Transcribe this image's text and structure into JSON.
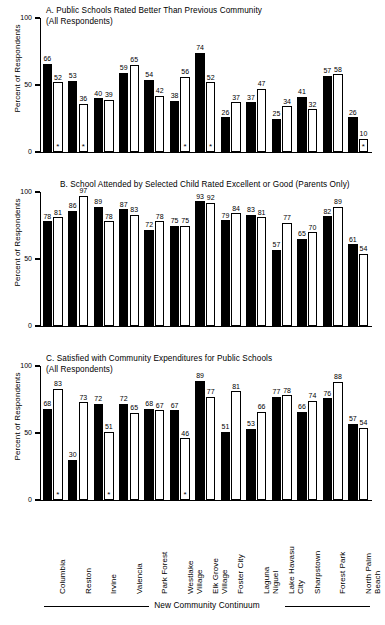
{
  "figure": {
    "ylabel": "Percent of Respondents",
    "x_axis_caption": "New Community Continuum",
    "categories": [
      "Columbia",
      "Reston",
      "Irvine",
      "Valencia",
      "Park Forest",
      "Westlake\nVillage",
      "Elk Grove\nVillage",
      "Foster City",
      "Laguna\nNiguel",
      "Lake Havasu\nCity",
      "Sharpstown",
      "Forest Park",
      "North Palm\nBeach"
    ],
    "yticks": [
      "0",
      "50",
      "100"
    ],
    "ylim": [
      0,
      100
    ],
    "significance_marker": "*"
  },
  "chart_data": [
    {
      "id": "A",
      "type": "bar",
      "title": "A.  Public Schools Rated Better Than Previous Community\n(All Respondents)",
      "xlabel": "New Community Continuum",
      "ylabel": "Percent of Respondents",
      "ylim": [
        0,
        100
      ],
      "yticks": [
        0,
        50,
        100
      ],
      "grid": false,
      "legend": "none",
      "categories": [
        "Columbia",
        "Reston",
        "Irvine",
        "Valencia",
        "Park Forest",
        "Westlake Village",
        "Elk Grove Village",
        "Foster City",
        "Laguna Niguel",
        "Lake Havasu City",
        "Sharpstown",
        "Forest Park",
        "North Palm Beach"
      ],
      "series": [
        {
          "name": "New Community",
          "style": "solid",
          "values": [
            66,
            53,
            40,
            59,
            54,
            38,
            74,
            26,
            37,
            25,
            41,
            57,
            26
          ]
        },
        {
          "name": "Paired Conventional Community",
          "style": "open",
          "values": [
            52,
            36,
            39,
            65,
            42,
            56,
            52,
            37,
            47,
            34,
            32,
            58,
            10
          ]
        }
      ],
      "markers": [
        {
          "category_index": 0,
          "series": "open",
          "symbol": "*"
        },
        {
          "category_index": 1,
          "series": "open",
          "symbol": "*"
        },
        {
          "category_index": 5,
          "series": "open",
          "symbol": "*"
        },
        {
          "category_index": 6,
          "series": "open",
          "symbol": "*"
        },
        {
          "category_index": 12,
          "series": "open",
          "symbol": "*"
        }
      ]
    },
    {
      "id": "B",
      "type": "bar",
      "title": "B.  School Attended by Selected Child Rated Excellent or Good (Parents Only)",
      "xlabel": "New Community Continuum",
      "ylabel": "Percent of Respondents",
      "ylim": [
        0,
        100
      ],
      "yticks": [
        0,
        50,
        100
      ],
      "grid": false,
      "legend": "none",
      "categories": [
        "Columbia",
        "Reston",
        "Irvine",
        "Valencia",
        "Park Forest",
        "Westlake Village",
        "Elk Grove Village",
        "Foster City",
        "Laguna Niguel",
        "Lake Havasu City",
        "Sharpstown",
        "Forest Park",
        "North Palm Beach"
      ],
      "series": [
        {
          "name": "New Community",
          "style": "solid",
          "values": [
            78,
            86,
            89,
            87,
            72,
            75,
            93,
            79,
            83,
            57,
            65,
            82,
            61
          ]
        },
        {
          "name": "Paired Conventional Community",
          "style": "open",
          "values": [
            81,
            97,
            78,
            83,
            78,
            75,
            92,
            84,
            81,
            77,
            70,
            89,
            54
          ]
        }
      ],
      "markers": []
    },
    {
      "id": "C",
      "type": "bar",
      "title": "C.  Satisfied with Community Expenditures for Public Schools\n(All Respondents)",
      "xlabel": "New Community Continuum",
      "ylabel": "Percent of Respondents",
      "ylim": [
        0,
        100
      ],
      "yticks": [
        0,
        50,
        100
      ],
      "grid": false,
      "legend": "none",
      "categories": [
        "Columbia",
        "Reston",
        "Irvine",
        "Valencia",
        "Park Forest",
        "Westlake Village",
        "Elk Grove Village",
        "Foster City",
        "Laguna Niguel",
        "Lake Havasu City",
        "Sharpstown",
        "Forest Park",
        "North Palm Beach"
      ],
      "series": [
        {
          "name": "New Community",
          "style": "solid",
          "values": [
            68,
            30,
            72,
            72,
            68,
            67,
            89,
            51,
            53,
            77,
            66,
            76,
            57
          ]
        },
        {
          "name": "Paired Conventional Community",
          "style": "open",
          "values": [
            83,
            73,
            51,
            65,
            67,
            46,
            77,
            81,
            66,
            78,
            74,
            88,
            54
          ]
        }
      ],
      "markers": [
        {
          "category_index": 0,
          "series": "open",
          "symbol": "*"
        },
        {
          "category_index": 2,
          "series": "open",
          "symbol": "*"
        },
        {
          "category_index": 5,
          "series": "open",
          "symbol": "*"
        }
      ]
    }
  ]
}
